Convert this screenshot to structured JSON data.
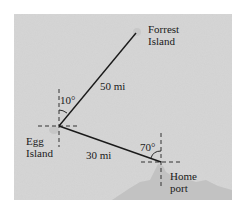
{
  "diagram": {
    "type": "navigation-bearing-diagram",
    "colors": {
      "page": "#ffffff",
      "sea": "#d6d6d6",
      "land": "#c4c4c4",
      "line": "#1a1a1a",
      "dashed": "#333333"
    },
    "points": {
      "forrest_island": {
        "label_line1": "Forrest",
        "label_line2": "Island"
      },
      "egg_island": {
        "label_line1": "Egg",
        "label_line2": "Island"
      },
      "home_port": {
        "label_line1": "Home",
        "label_line2": "port"
      }
    },
    "segments": {
      "egg_to_forrest": {
        "distance": "50 mi"
      },
      "egg_to_home": {
        "distance": "30 mi"
      }
    },
    "angles": {
      "at_egg_island": "10°",
      "at_home_port": "70°"
    }
  }
}
